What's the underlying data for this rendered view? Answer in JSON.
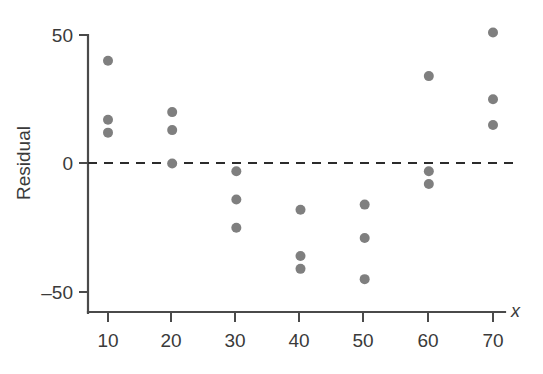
{
  "chart_data": {
    "type": "scatter",
    "title": "",
    "xlabel": "x",
    "ylabel": "Residual",
    "xlim": [
      3,
      77
    ],
    "ylim": [
      -58,
      57
    ],
    "grid": false,
    "legend": null,
    "reference_line": {
      "name": "zero-residual-line",
      "orientation": "horizontal",
      "y": 0,
      "style": "dashed"
    },
    "x_ticks": [
      10,
      20,
      30,
      40,
      50,
      60,
      70
    ],
    "x_tick_labels": [
      "10",
      "20",
      "30",
      "40",
      "50",
      "60",
      "70"
    ],
    "y_ticks": [
      50,
      0,
      -50
    ],
    "y_tick_labels": [
      "50",
      "0",
      "–50"
    ],
    "point_color": "#7f7f7f",
    "point_radius_px": 5,
    "series": [
      {
        "name": "residuals",
        "points": [
          {
            "x": 10,
            "y": 40
          },
          {
            "x": 10,
            "y": 17
          },
          {
            "x": 10,
            "y": 12
          },
          {
            "x": 20,
            "y": 20
          },
          {
            "x": 20,
            "y": 13
          },
          {
            "x": 20,
            "y": 0
          },
          {
            "x": 30,
            "y": -3
          },
          {
            "x": 30,
            "y": -14
          },
          {
            "x": 30,
            "y": -25
          },
          {
            "x": 40,
            "y": -18
          },
          {
            "x": 40,
            "y": -36
          },
          {
            "x": 40,
            "y": -41
          },
          {
            "x": 50,
            "y": -16
          },
          {
            "x": 50,
            "y": -29
          },
          {
            "x": 50,
            "y": -45
          },
          {
            "x": 60,
            "y": 34
          },
          {
            "x": 60,
            "y": -3
          },
          {
            "x": 60,
            "y": -8
          },
          {
            "x": 70,
            "y": 51
          },
          {
            "x": 70,
            "y": 25
          },
          {
            "x": 70,
            "y": 15
          }
        ]
      }
    ]
  },
  "axes": {
    "y_label": "Residual",
    "x_label": "x",
    "y_tick_labels": [
      "50",
      "0",
      "–50"
    ],
    "x_tick_labels": [
      "10",
      "20",
      "30",
      "40",
      "50",
      "60",
      "70"
    ]
  },
  "colors": {
    "point": "#7f7f7f",
    "axis": "#4a4a4a",
    "zero_line": "#2b2b2b",
    "text": "#3a3a3a",
    "background": "#ffffff"
  }
}
